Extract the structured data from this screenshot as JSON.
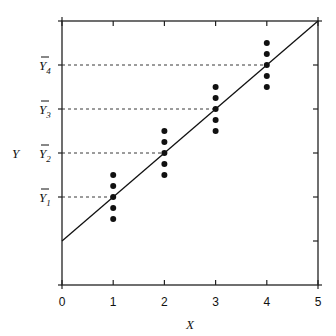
{
  "chart_data": {
    "type": "scatter",
    "title": "",
    "xlabel": "X",
    "ylabel": "Y",
    "xlim": [
      0,
      5
    ],
    "ylim": [
      0,
      6
    ],
    "x_ticks": [
      "0",
      "1",
      "2",
      "3",
      "4",
      "5"
    ],
    "y_tick_labels": [
      {
        "label": "Y",
        "subscript": "1",
        "value": 2
      },
      {
        "label": "Y",
        "subscript": "2",
        "value": 3
      },
      {
        "label": "Y",
        "subscript": "3",
        "value": 4
      },
      {
        "label": "Y",
        "subscript": "4",
        "value": 5
      }
    ],
    "regression_line": {
      "intercept": 1,
      "slope": 1,
      "x_range": [
        0,
        5
      ]
    },
    "series": [
      {
        "name": "observations",
        "points": [
          {
            "x": 1,
            "y": 1.5
          },
          {
            "x": 1,
            "y": 1.75
          },
          {
            "x": 1,
            "y": 2
          },
          {
            "x": 1,
            "y": 2.25
          },
          {
            "x": 1,
            "y": 2.5
          },
          {
            "x": 2,
            "y": 2.5
          },
          {
            "x": 2,
            "y": 2.75
          },
          {
            "x": 2,
            "y": 3
          },
          {
            "x": 2,
            "y": 3.25
          },
          {
            "x": 2,
            "y": 3.5
          },
          {
            "x": 3,
            "y": 3.5
          },
          {
            "x": 3,
            "y": 3.75
          },
          {
            "x": 3,
            "y": 4
          },
          {
            "x": 3,
            "y": 4.25
          },
          {
            "x": 3,
            "y": 4.5
          },
          {
            "x": 4,
            "y": 4.5
          },
          {
            "x": 4,
            "y": 4.75
          },
          {
            "x": 4,
            "y": 5
          },
          {
            "x": 4,
            "y": 5.25
          },
          {
            "x": 4,
            "y": 5.5
          }
        ]
      }
    ],
    "mean_guides": [
      {
        "x": 1,
        "y": 2
      },
      {
        "x": 2,
        "y": 3
      },
      {
        "x": 3,
        "y": 4
      },
      {
        "x": 4,
        "y": 5
      }
    ],
    "grid": false
  }
}
